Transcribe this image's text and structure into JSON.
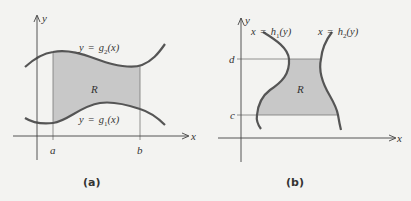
{
  "panels": [
    {
      "id": "a",
      "caption": "(a)",
      "axis_labels": {
        "x": "x",
        "y": "y"
      },
      "tick_labels": {
        "a": "a",
        "b": "b"
      },
      "region_label": "R",
      "upper_curve": {
        "lhs": "y",
        "eq": "=",
        "fn": "g",
        "sub": "2",
        "arg": "(x)"
      },
      "lower_curve": {
        "lhs": "y",
        "eq": "=",
        "fn": "g",
        "sub": "1",
        "arg": "(x)"
      }
    },
    {
      "id": "b",
      "caption": "(b)",
      "axis_labels": {
        "x": "x",
        "y": "y"
      },
      "tick_labels": {
        "d": "d",
        "c": "c"
      },
      "region_label": "R",
      "left_curve": {
        "lhs": "x",
        "eq": "=",
        "fn": "h",
        "sub": "1",
        "arg": "(y)"
      },
      "right_curve": {
        "lhs": "x",
        "eq": "=",
        "fn": "h",
        "sub": "2",
        "arg": "(y)"
      }
    }
  ],
  "colors": {
    "background": "#f3f3f1",
    "region_fill": "#c8c8c8",
    "curve": "#555555",
    "axis": "#444444",
    "guide": "#777777"
  }
}
